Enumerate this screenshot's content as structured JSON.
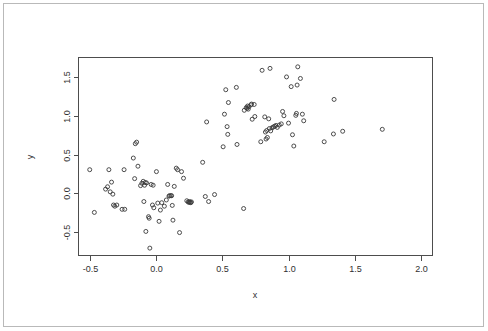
{
  "figure": {
    "title": "",
    "background_color": "#ffffff",
    "frame_color": "#b9b9b9",
    "axis_color": "#4d4d4d",
    "point_color": "#3a3a3a"
  },
  "axes": {
    "x_title": "x",
    "y_title": "y",
    "x_tick_labels": [
      "-0.5",
      "0.0",
      "0.5",
      "1.0",
      "1.5",
      "2.0"
    ],
    "y_tick_labels": [
      "-0.5",
      "0.0",
      "0.5",
      "1.0",
      "1.5"
    ]
  },
  "chart_data": {
    "type": "scatter",
    "title": "",
    "xlabel": "x",
    "ylabel": "y",
    "xlim": [
      -0.59,
      2.09
    ],
    "ylim": [
      -0.8,
      1.75
    ],
    "xticks": [
      -0.5,
      0.0,
      0.5,
      1.0,
      1.5,
      2.0
    ],
    "yticks": [
      -0.5,
      0.0,
      0.5,
      1.0,
      1.5
    ],
    "grid": false,
    "legend": null,
    "marker": "open-circle",
    "marker_size": 4,
    "n_points": 131,
    "series": [
      {
        "name": "points",
        "points": [
          [
            -0.505,
            0.305
          ],
          [
            -0.47,
            -0.245
          ],
          [
            -0.385,
            0.055
          ],
          [
            -0.37,
            0.085
          ],
          [
            -0.36,
            0.305
          ],
          [
            -0.35,
            0.02
          ],
          [
            -0.34,
            0.145
          ],
          [
            -0.33,
            -0.01
          ],
          [
            -0.325,
            -0.15
          ],
          [
            -0.315,
            -0.165
          ],
          [
            -0.3,
            -0.15
          ],
          [
            -0.26,
            -0.205
          ],
          [
            -0.245,
            0.305
          ],
          [
            -0.24,
            -0.205
          ],
          [
            -0.175,
            0.455
          ],
          [
            -0.165,
            0.19
          ],
          [
            -0.16,
            0.64
          ],
          [
            -0.15,
            0.66
          ],
          [
            -0.14,
            0.35
          ],
          [
            -0.12,
            0.1
          ],
          [
            -0.11,
            0.13
          ],
          [
            -0.1,
            0.155
          ],
          [
            -0.095,
            -0.105
          ],
          [
            -0.09,
            0.105
          ],
          [
            -0.085,
            0.14
          ],
          [
            -0.08,
            -0.49
          ],
          [
            -0.075,
            0.135
          ],
          [
            -0.06,
            -0.3
          ],
          [
            -0.055,
            -0.32
          ],
          [
            -0.05,
            -0.705
          ],
          [
            -0.04,
            0.115
          ],
          [
            -0.03,
            -0.15
          ],
          [
            -0.025,
            0.105
          ],
          [
            -0.02,
            -0.185
          ],
          [
            0.0,
            0.28
          ],
          [
            0.01,
            -0.125
          ],
          [
            0.02,
            -0.36
          ],
          [
            0.03,
            -0.215
          ],
          [
            0.04,
            -0.12
          ],
          [
            0.06,
            -0.165
          ],
          [
            0.075,
            -0.085
          ],
          [
            0.085,
            0.115
          ],
          [
            0.095,
            -0.035
          ],
          [
            0.1,
            -0.03
          ],
          [
            0.11,
            -0.03
          ],
          [
            0.115,
            -0.03
          ],
          [
            0.12,
            -0.155
          ],
          [
            0.125,
            -0.345
          ],
          [
            0.135,
            0.09
          ],
          [
            0.15,
            0.325
          ],
          [
            0.16,
            0.305
          ],
          [
            0.175,
            -0.505
          ],
          [
            0.19,
            0.28
          ],
          [
            0.205,
            0.195
          ],
          [
            0.23,
            -0.095
          ],
          [
            0.24,
            -0.11
          ],
          [
            0.245,
            -0.115
          ],
          [
            0.25,
            -0.105
          ],
          [
            0.255,
            -0.115
          ],
          [
            0.26,
            -0.12
          ],
          [
            0.265,
            -0.11
          ],
          [
            0.35,
            0.4
          ],
          [
            0.37,
            -0.04
          ],
          [
            0.38,
            0.92
          ],
          [
            0.395,
            -0.105
          ],
          [
            0.44,
            -0.015
          ],
          [
            0.505,
            0.6
          ],
          [
            0.515,
            1.02
          ],
          [
            0.525,
            1.335
          ],
          [
            0.535,
            0.86
          ],
          [
            0.54,
            0.76
          ],
          [
            0.545,
            1.17
          ],
          [
            0.605,
            1.365
          ],
          [
            0.61,
            0.63
          ],
          [
            0.66,
            -0.195
          ],
          [
            0.665,
            1.07
          ],
          [
            0.68,
            1.105
          ],
          [
            0.685,
            1.095
          ],
          [
            0.69,
            1.125
          ],
          [
            0.695,
            1.085
          ],
          [
            0.7,
            1.115
          ],
          [
            0.715,
            1.14
          ],
          [
            0.72,
            1.15
          ],
          [
            0.725,
            0.955
          ],
          [
            0.74,
            1.145
          ],
          [
            0.745,
            0.99
          ],
          [
            0.79,
            0.665
          ],
          [
            0.8,
            1.585
          ],
          [
            0.82,
            0.985
          ],
          [
            0.825,
            0.79
          ],
          [
            0.83,
            0.7
          ],
          [
            0.835,
            0.81
          ],
          [
            0.84,
            0.72
          ],
          [
            0.85,
            0.96
          ],
          [
            0.855,
            0.835
          ],
          [
            0.86,
            1.61
          ],
          [
            0.865,
            0.805
          ],
          [
            0.875,
            0.845
          ],
          [
            0.885,
            0.855
          ],
          [
            0.895,
            0.865
          ],
          [
            0.905,
            0.875
          ],
          [
            0.915,
            0.85
          ],
          [
            0.93,
            0.88
          ],
          [
            0.945,
            0.895
          ],
          [
            0.955,
            1.055
          ],
          [
            0.965,
            1.0
          ],
          [
            0.985,
            1.5
          ],
          [
            1.0,
            0.905
          ],
          [
            1.02,
            1.375
          ],
          [
            1.03,
            0.755
          ],
          [
            1.04,
            0.61
          ],
          [
            1.055,
            1.005
          ],
          [
            1.06,
            1.03
          ],
          [
            1.065,
            1.395
          ],
          [
            1.07,
            1.63
          ],
          [
            1.09,
            1.48
          ],
          [
            1.105,
            1.02
          ],
          [
            1.115,
            0.935
          ],
          [
            1.27,
            0.665
          ],
          [
            1.34,
            0.765
          ],
          [
            1.345,
            1.21
          ],
          [
            1.41,
            0.8
          ],
          [
            1.71,
            0.825
          ]
        ]
      }
    ]
  }
}
